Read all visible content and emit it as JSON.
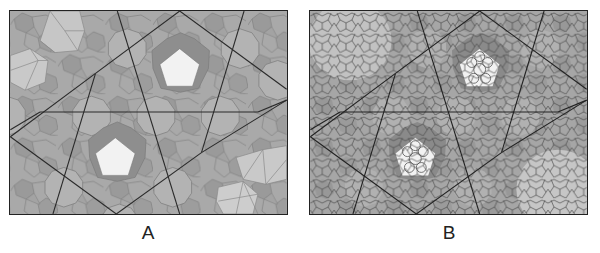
{
  "figure": {
    "panels": [
      {
        "id": "A",
        "label": "A",
        "description": "Quasi-periodic decagonal tiling of gray polygons (decagons, pentagons, hexagons) with two white pentagons and superimposed long black superstructure lines",
        "white_pentagons": 2
      },
      {
        "id": "B",
        "label": "B",
        "description": "Same tiling overlaid with dense girih strapwork line pattern; white pentagons contain interlaced rosette lines",
        "white_pentagons": 2
      }
    ],
    "colors": {
      "background": "#ffffff",
      "tile_medium": "#a9a9a9",
      "tile_dark": "#8c8c8c",
      "tile_light": "#bdbdbd",
      "tile_lightest": "#d2d2d2",
      "highlight_pentagon": "#f2f2f2",
      "superstructure_line": "#2a2a2a",
      "tile_edge": "#7a7a7a",
      "border": "#222222"
    }
  }
}
